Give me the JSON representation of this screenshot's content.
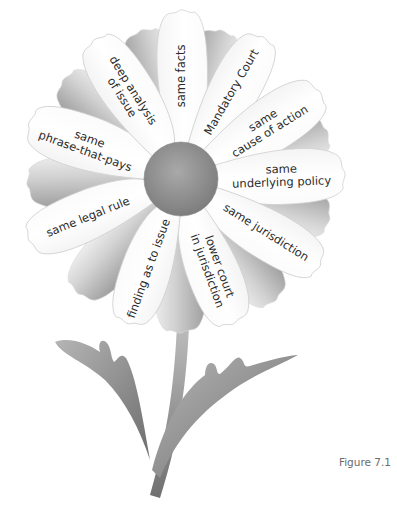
{
  "figure": {
    "caption": "Figure 7.1",
    "center": {
      "label": ""
    },
    "petals": [
      {
        "id": "same-facts",
        "lines": [
          "same facts"
        ]
      },
      {
        "id": "mandatory-court",
        "lines": [
          "Mandatory Court"
        ]
      },
      {
        "id": "same-cause-of-action",
        "lines": [
          "same",
          "cause of action"
        ]
      },
      {
        "id": "same-underlying-policy",
        "lines": [
          "same",
          "underlying policy"
        ]
      },
      {
        "id": "same-jurisdiction",
        "lines": [
          "same jurisdiction"
        ]
      },
      {
        "id": "lower-court-in-jurisdiction",
        "lines": [
          "lower court",
          "in jurisdiction"
        ]
      },
      {
        "id": "finding-as-to-issue",
        "lines": [
          "finding as to issue"
        ]
      },
      {
        "id": "same-legal-rule",
        "lines": [
          "same legal rule"
        ]
      },
      {
        "id": "same-phrase-that-pays",
        "lines": [
          "same",
          "phrase-that-pays"
        ]
      },
      {
        "id": "deep-analysis-of-issue",
        "lines": [
          "deep analysis",
          "of issue"
        ]
      }
    ]
  }
}
